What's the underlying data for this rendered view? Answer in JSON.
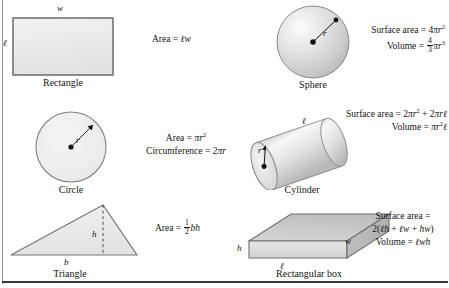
{
  "sheet": {
    "title": "Geometry formulas reference",
    "background": "#ffffff",
    "shape_fill": "#e8e8e8",
    "shape_stroke": "#6e6e6e",
    "text_color": "#141414",
    "rule_color": "#3a3a3a"
  },
  "figures": [
    {
      "id": "rectangle",
      "caption": "Rectangle",
      "labels": {
        "width": "w",
        "length": "ℓ"
      },
      "formulas": [
        {
          "lhs": "Area",
          "rel": "=",
          "rhs_html": "<i class=\"v\">ℓw</i>"
        }
      ]
    },
    {
      "id": "sphere",
      "caption": "Sphere",
      "labels": {
        "radius": "r"
      },
      "formulas": [
        {
          "lhs": "Surface area",
          "rel": "=",
          "rhs_html": "4<span class=\"pi\">π</span><i class=\"v\">r</i><sup>2</sup>"
        },
        {
          "lhs": "Volume",
          "rel": "=",
          "rhs_html": "<span class=\"frac\"><span class=\"num\">4</span><span class=\"den\">3</span></span><span class=\"pi\">π</span><i class=\"v\">r</i><sup>3</sup>"
        }
      ]
    },
    {
      "id": "circle",
      "caption": "Circle",
      "labels": {
        "radius": "r"
      },
      "formulas": [
        {
          "lhs": "Area",
          "rel": "=",
          "rhs_html": "<span class=\"pi\">π</span><i class=\"v\">r</i><sup>2</sup>"
        },
        {
          "lhs": "Circumference",
          "rel": "=",
          "rhs_html": "2<span class=\"pi\">π</span><i class=\"v\">r</i>"
        }
      ]
    },
    {
      "id": "cylinder",
      "caption": "Cylinder",
      "labels": {
        "radius": "r",
        "length": "ℓ"
      },
      "formulas": [
        {
          "lhs": "Surface area",
          "rel": "=",
          "rhs_html": "2<span class=\"pi\">π</span><i class=\"v\">r</i><sup>2</sup> + 2<span class=\"pi\">π</span><i class=\"v\">rℓ</i>"
        },
        {
          "lhs": "Volume",
          "rel": "=",
          "rhs_html": "<span class=\"pi\">π</span><i class=\"v\">r</i><sup>2</sup><i class=\"v\">ℓ</i>"
        }
      ]
    },
    {
      "id": "triangle",
      "caption": "Triangle",
      "labels": {
        "base": "b",
        "height": "h"
      },
      "formulas": [
        {
          "lhs": "Area",
          "rel": "=",
          "rhs_html": "<span class=\"frac\"><span class=\"num\">1</span><span class=\"den\">2</span></span><i class=\"v\">bh</i>"
        }
      ]
    },
    {
      "id": "rectangular-box",
      "caption": "Rectangular box",
      "labels": {
        "height": "h",
        "width": "w",
        "length": "ℓ"
      },
      "formulas": [
        {
          "lhs": "Surface area",
          "rel": "=",
          "rhs_html": ""
        },
        {
          "lhs": "",
          "rel": "",
          "rhs_html": "2(<i class=\"v\">ℓh</i> + <i class=\"v\">ℓw</i> + <i class=\"v\">hw</i>)"
        },
        {
          "lhs": "Volume",
          "rel": "=",
          "rhs_html": "<i class=\"v\">ℓwh</i>"
        }
      ]
    }
  ],
  "text": {
    "rect_caption": "Rectangle",
    "rect_w": "w",
    "rect_l": "ℓ",
    "rect_area_label": "Area = ",
    "sphere_caption": "Sphere",
    "sphere_r": "r",
    "sphere_sa_label": "Surface area = ",
    "sphere_vol_label": "Volume = ",
    "circle_caption": "Circle",
    "circle_r": "r",
    "circle_area_label": "Area = ",
    "circle_circ_label": "Circumference = ",
    "cyl_caption": "Cylinder",
    "cyl_r": "r",
    "cyl_l": "ℓ",
    "cyl_sa_label": "Surface area = ",
    "cyl_vol_label": "Volume = ",
    "tri_caption": "Triangle",
    "tri_b": "b",
    "tri_h": "h",
    "tri_area_label": "Area = ",
    "box_caption": "Rectangular box",
    "box_h": "h",
    "box_w": "w",
    "box_l": "ℓ",
    "box_sa_label": "Surface area =",
    "box_vol_label": "Volume = "
  }
}
